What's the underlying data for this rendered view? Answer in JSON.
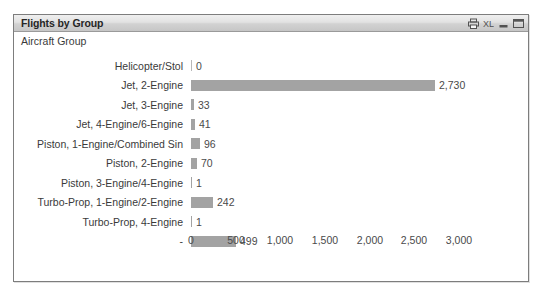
{
  "window": {
    "title": "Flights by Group",
    "buttons": [
      {
        "name": "print-icon",
        "label": "Print"
      },
      {
        "name": "export-excel-icon",
        "label": "XL"
      },
      {
        "name": "minimize-icon",
        "label": "Minimize"
      },
      {
        "name": "maximize-icon",
        "label": "Maximize"
      }
    ]
  },
  "dimension_label": "Aircraft Group",
  "chart_data": {
    "type": "bar",
    "orientation": "horizontal",
    "title": "Flights by Group",
    "xlabel": "",
    "ylabel": "Aircraft Group",
    "xlim": [
      0,
      3000
    ],
    "grid": false,
    "legend": "none",
    "categories": [
      "Helicopter/Stol",
      "Jet, 2-Engine",
      "Jet, 3-Engine",
      "Jet, 4-Engine/6-Engine",
      "Piston, 1-Engine/Combined Sin",
      "Piston, 2-Engine",
      "Piston, 3-Engine/4-Engine",
      "Turbo-Prop, 1-Engine/2-Engine",
      "Turbo-Prop, 4-Engine",
      "-"
    ],
    "values": [
      0,
      2730,
      33,
      41,
      96,
      70,
      1,
      242,
      1,
      499
    ],
    "value_labels": [
      "0",
      "2,730",
      "33",
      "41",
      "96",
      "70",
      "1",
      "242",
      "1",
      "499"
    ],
    "xticks": [
      0,
      500,
      1000,
      1500,
      2000,
      2500,
      3000
    ],
    "xtick_labels": [
      "0",
      "500",
      "1,000",
      "1,500",
      "2,000",
      "2,500",
      "3,000"
    ],
    "bar_color": "#a3a3a3"
  }
}
